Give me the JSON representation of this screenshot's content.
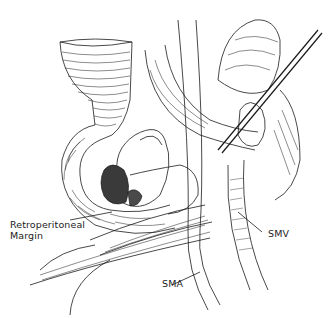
{
  "figure": {
    "type": "surgical line-art illustration",
    "background": "#ffffff",
    "ink_color": "#1a1a1a"
  },
  "labels": {
    "retroperitoneal": {
      "line1": "Retroperitoneal",
      "line2": "Margin"
    },
    "smv": "SMV",
    "sma": "SMA"
  }
}
